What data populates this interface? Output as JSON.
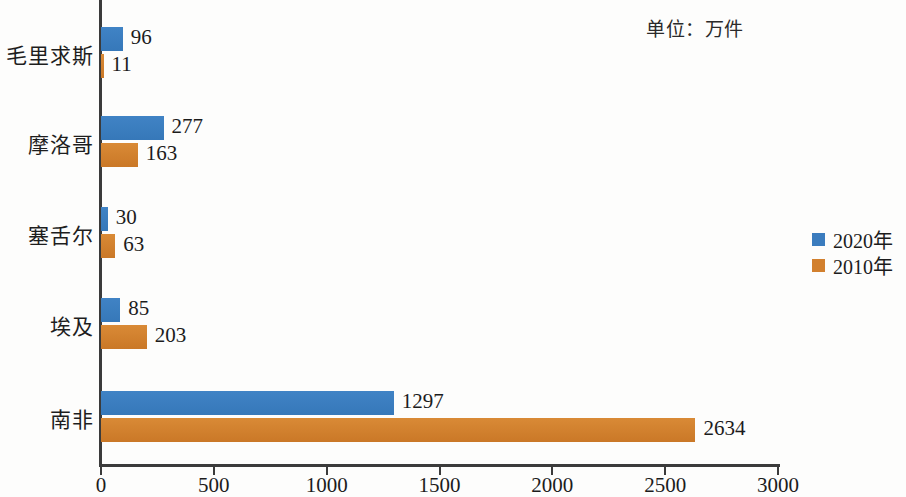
{
  "unit_note": "单位：万件",
  "legend": {
    "position": "right",
    "entries": [
      {
        "label": "2020年",
        "color": "#3b7cbe",
        "swatch_name": "legend-swatch-2020"
      },
      {
        "label": "2010年",
        "color": "#d2802e",
        "swatch_name": "legend-swatch-2010"
      }
    ]
  },
  "axis": {
    "ticks": [
      "0",
      "500",
      "1000",
      "1500",
      "2000",
      "2500",
      "3000"
    ],
    "tick_values": [
      0,
      500,
      1000,
      1500,
      2000,
      2500,
      3000
    ]
  },
  "chart_data": {
    "type": "bar",
    "orientation": "horizontal",
    "title": "",
    "subtitle": "",
    "xlabel": "",
    "ylabel": "",
    "annotations": [
      "单位：万件"
    ],
    "grid": false,
    "legend_position": "right",
    "xlim": [
      0,
      3000
    ],
    "categories": [
      "毛里求斯",
      "摩洛哥",
      "塞舌尔",
      "埃及",
      "南非"
    ],
    "series": [
      {
        "name": "2020年",
        "color": "#3b7cbe",
        "values": [
          96,
          277,
          30,
          85,
          1297
        ]
      },
      {
        "name": "2010年",
        "color": "#d2802e",
        "values": [
          11,
          163,
          63,
          203,
          2634
        ]
      }
    ]
  }
}
